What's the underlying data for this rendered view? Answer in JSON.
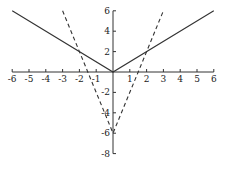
{
  "chart_data": {
    "type": "line",
    "title": "",
    "xlabel": "",
    "ylabel": "",
    "xlim": [
      -6,
      6
    ],
    "ylim": [
      -8,
      6
    ],
    "grid": false,
    "x_ticks": [
      -6,
      -5,
      -4,
      -3,
      -2,
      -1,
      1,
      2,
      3,
      4,
      5,
      6
    ],
    "y_ticks": [
      6,
      4,
      2,
      -2,
      -4,
      -6,
      -8
    ],
    "series": [
      {
        "name": "y = |x|",
        "style": "solid",
        "color": "#333333",
        "points": [
          [
            -6,
            6
          ],
          [
            0,
            0
          ],
          [
            6,
            6
          ]
        ]
      },
      {
        "name": "y = 4|x| - 6",
        "style": "dashed",
        "color": "#333333",
        "points": [
          [
            -3,
            6
          ],
          [
            -2,
            2
          ],
          [
            -1.5,
            0
          ],
          [
            0,
            -6
          ],
          [
            1.5,
            0
          ],
          [
            2,
            2
          ],
          [
            3,
            6
          ]
        ]
      }
    ],
    "intersections": [
      [
        -2,
        2
      ],
      [
        2,
        2
      ]
    ]
  },
  "mapping": {
    "origin_x": 113,
    "origin_y": 72,
    "px_per_unit_x": 16.8,
    "px_per_unit_y": 10.2
  }
}
